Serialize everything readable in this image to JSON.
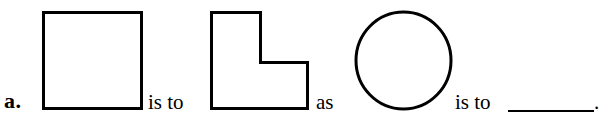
{
  "document": {
    "type": "worksheet-analogy-problem",
    "item_label": "a.",
    "connector_1": "is to",
    "connector_2": "as",
    "connector_3": "is to",
    "terminal_punctuation": ".",
    "answer_blank_value": "",
    "ink_color": "#000000",
    "background_color": "#ffffff"
  },
  "figures": [
    {
      "name": "square",
      "role": "analogy-term-1",
      "description": "Open square outline",
      "stroke_color": "#000000",
      "stroke_width": 3,
      "box": {
        "x": 41,
        "y": 10,
        "width": 100,
        "height": 98
      }
    },
    {
      "name": "l-shape",
      "role": "analogy-term-2",
      "description": "Square with upper-right quadrant removed (L shape)",
      "stroke_color": "#000000",
      "stroke_width": 3,
      "box": {
        "x": 209,
        "y": 10,
        "width": 99,
        "height": 98
      }
    },
    {
      "name": "circle",
      "role": "analogy-term-3",
      "description": "Open circle outline",
      "stroke_color": "#000000",
      "stroke_width": 3,
      "box": {
        "x": 353,
        "y": 9,
        "width": 98,
        "height": 100
      }
    },
    {
      "name": "answer-blank",
      "role": "analogy-term-4",
      "description": "Empty ruled line for the student's answer",
      "stroke_color": "#000000",
      "box": {
        "x": 508,
        "y": 110,
        "width": 86,
        "height": 2
      }
    }
  ]
}
